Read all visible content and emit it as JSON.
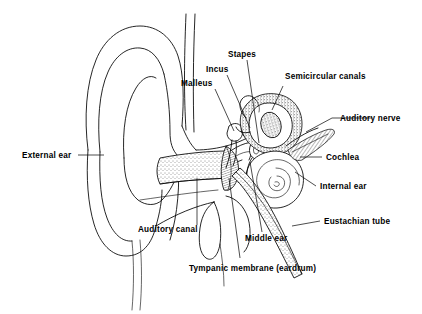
{
  "diagram": {
    "background_color": "#ffffff",
    "line_color": "#000000",
    "width": 422,
    "height": 314,
    "style": "black-and-white line drawing with stippled shading"
  },
  "labels": {
    "stapes": "Stapes",
    "incus": "Incus",
    "malleus": "Malleus",
    "semicircular_canals": "Semicircular canals",
    "auditory_nerve": "Auditory nerve",
    "cochlea": "Cochlea",
    "internal_ear": "Internal ear",
    "eustachian_tube": "Eustachian tube",
    "external_ear": "External ear",
    "auditory_canal": "Auditory canal",
    "middle_ear": "Middle ear",
    "tympanic_membrane": "Tympanic membrane (eardrum)"
  },
  "regions": [
    {
      "name": "pinna",
      "label": "External ear",
      "side": "left"
    },
    {
      "name": "auditory-canal",
      "label": "Auditory canal",
      "side": "left"
    },
    {
      "name": "tympanic-membrane",
      "label": "Tympanic membrane (eardrum)",
      "side": "bottom"
    },
    {
      "name": "ossicles-malleus",
      "label": "Malleus",
      "side": "top"
    },
    {
      "name": "ossicles-incus",
      "label": "Incus",
      "side": "top"
    },
    {
      "name": "ossicles-stapes",
      "label": "Stapes",
      "side": "top"
    },
    {
      "name": "middle-ear-cavity",
      "label": "Middle ear",
      "side": "bottom"
    },
    {
      "name": "semicircular-canals",
      "label": "Semicircular canals",
      "side": "top"
    },
    {
      "name": "auditory-nerve",
      "label": "Auditory nerve",
      "side": "right"
    },
    {
      "name": "cochlea",
      "label": "Cochlea",
      "side": "right"
    },
    {
      "name": "internal-ear",
      "label": "Internal ear",
      "side": "right"
    },
    {
      "name": "eustachian-tube",
      "label": "Eustachian tube",
      "side": "right"
    }
  ]
}
